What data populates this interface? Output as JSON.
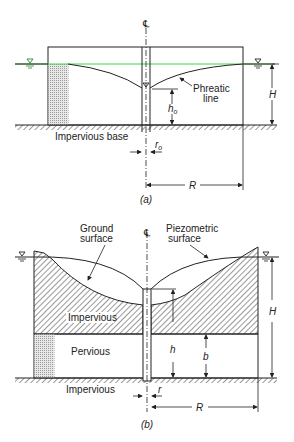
{
  "figure_a": {
    "centerline_symbol": "℄",
    "phreatic_label_line1": "Phreatic",
    "phreatic_label_line2": "line",
    "impervious_base_label": "Impervious base",
    "h0_label": "h",
    "h0_sub": "o",
    "r0_label": "r",
    "r0_sub": "o",
    "H_label": "H",
    "R_label": "R",
    "caption": "(a)",
    "water_table_color": "#3fd43f"
  },
  "figure_b": {
    "centerline_symbol": "℄",
    "ground_surface_line1": "Ground",
    "ground_surface_line2": "surface",
    "piezometric_line1": "Piezometric",
    "piezometric_line2": "surface",
    "impervious_top_label": "Impervious",
    "pervious_label": "Pervious",
    "impervious_bottom_label": "Impervious",
    "h_label": "h",
    "b_label": "b",
    "r_label": "r",
    "H_label": "H",
    "R_label": "R",
    "caption": "(b)"
  }
}
